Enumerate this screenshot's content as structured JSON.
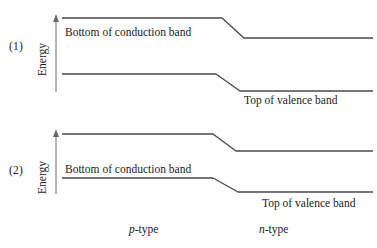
{
  "figure": {
    "line_color": "#4a4a4a",
    "axis_color": "#6b6b6b",
    "background": "#ffffff"
  },
  "panels": [
    {
      "index_label": "(1)",
      "axis_label": "Energy",
      "conduction_label": "Bottom of conduction band",
      "valence_label": "Top of valence band",
      "conduction_band": {
        "left_y": 18,
        "right_y": 38,
        "bend_start_x": 222,
        "bend_end_x": 244,
        "x_start": 62,
        "x_end": 373
      },
      "valence_band": {
        "left_y": 74,
        "right_y": 91,
        "bend_start_x": 216,
        "bend_end_x": 240,
        "x_start": 62,
        "x_end": 373
      },
      "axis": {
        "x": 56,
        "y_top": 17,
        "y_bottom": 92
      }
    },
    {
      "index_label": "(2)",
      "axis_label": "Energy",
      "conduction_label": "Bottom of conduction band",
      "valence_label": "Top of valence band",
      "conduction_band": {
        "left_y": 10,
        "right_y": 27,
        "bend_start_x": 213,
        "bend_end_x": 236,
        "x_start": 62,
        "x_end": 373
      },
      "valence_band": {
        "left_y": 54,
        "right_y": 68,
        "bend_start_x": 213,
        "bend_end_x": 238,
        "x_start": 62,
        "x_end": 373
      },
      "axis": {
        "x": 56,
        "y_top": 8,
        "y_bottom": 70
      }
    }
  ],
  "regions": {
    "p_symbol": "p",
    "p_suffix": "-type",
    "n_symbol": "n",
    "n_suffix": "-type"
  },
  "chart_data": {
    "type": "line",
    "xlabel": "",
    "ylabel": "Energy",
    "grid": false,
    "legend": "none",
    "regions": [
      "p-type",
      "n-type"
    ],
    "panels": [
      {
        "name": "(1)",
        "description": "Wider band gap; conduction and valence bands step down from p-type to n-type side",
        "series": [
          {
            "name": "Bottom of conduction band",
            "x": [
              62,
              222,
              244,
              373
            ],
            "y_energy_arbitrary": [
              1.0,
              1.0,
              0.74,
              0.74
            ]
          },
          {
            "name": "Top of valence band",
            "x": [
              62,
              216,
              240,
              373
            ],
            "y_energy_arbitrary": [
              0.28,
              0.28,
              0.06,
              0.06
            ]
          }
        ]
      },
      {
        "name": "(2)",
        "description": "Narrower band gap; conduction and valence bands step down from p-type to n-type side",
        "series": [
          {
            "name": "Bottom of conduction band",
            "x": [
              62,
              213,
              236,
              373
            ],
            "y_energy_arbitrary": [
              1.0,
              1.0,
              0.78,
              0.78
            ]
          },
          {
            "name": "Top of valence band",
            "x": [
              62,
              213,
              238,
              373
            ],
            "y_energy_arbitrary": [
              0.43,
              0.43,
              0.25,
              0.25
            ]
          }
        ]
      }
    ]
  }
}
